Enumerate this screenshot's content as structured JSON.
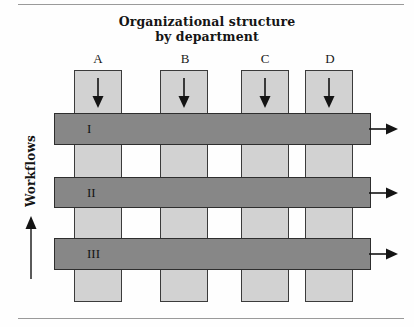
{
  "figure": {
    "title_line1": "Organizational structure",
    "title_line2": "by department",
    "vertical_axis_label": "Workflows"
  },
  "colors": {
    "column_fill": "#d2d2d2",
    "column_stroke": "#3b3b3b",
    "row_fill": "#878787",
    "row_stroke": "#2e2e2e",
    "arrow": "#141414",
    "rule": "#9a9a9a"
  },
  "diagram": {
    "type": "matrix-organization",
    "columns": [
      {
        "label": "A",
        "name": "department-a",
        "x": 74,
        "width": 48,
        "flow_direction": "down"
      },
      {
        "label": "B",
        "name": "department-b",
        "x": 160,
        "width": 48,
        "flow_direction": "down"
      },
      {
        "label": "C",
        "name": "department-c",
        "x": 241,
        "width": 48,
        "flow_direction": "down"
      },
      {
        "label": "D",
        "name": "department-d",
        "x": 305,
        "width": 48,
        "flow_direction": "down"
      }
    ],
    "rows": [
      {
        "label": "I",
        "name": "workflow-i",
        "y": 113,
        "height": 32,
        "flow_direction": "right"
      },
      {
        "label": "II",
        "name": "workflow-ii",
        "y": 177,
        "height": 31,
        "flow_direction": "right"
      },
      {
        "label": "III",
        "name": "workflow-iii",
        "y": 238,
        "height": 32,
        "flow_direction": "right"
      }
    ],
    "column_span": {
      "top": 70,
      "bottom": 302
    },
    "row_span": {
      "left": 54,
      "right": 371
    }
  }
}
